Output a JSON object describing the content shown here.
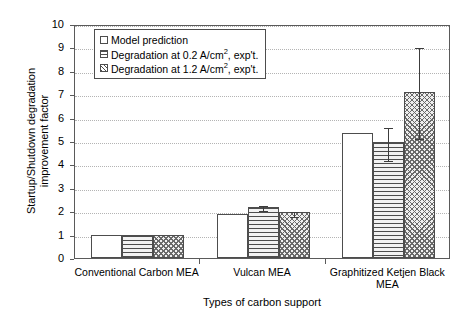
{
  "chart_data": {
    "type": "bar",
    "title": "",
    "xlabel": "Types of carbon support",
    "ylabel": "Startup/Shutdown degradation improvement factor",
    "categories": [
      "Conventional Carbon MEA",
      "Vulcan MEA",
      "Graphitized Ketjen Black MEA"
    ],
    "ylim": [
      0,
      10
    ],
    "ytick_labels": [
      "0",
      "1",
      "2",
      "3",
      "4",
      "5",
      "6",
      "7",
      "8",
      "9",
      "10"
    ],
    "grid": true,
    "legend_position": "upper-left-inside",
    "series": [
      {
        "name": "Model prediction",
        "pattern": "plain",
        "values": [
          1.0,
          1.9,
          5.35
        ],
        "errors": [
          null,
          null,
          null
        ]
      },
      {
        "name": "Degradation at 0.2 A/cm2, exp't.",
        "pattern": "horizontal-lines",
        "values": [
          1.0,
          2.2,
          4.95
        ],
        "errors": [
          null,
          0.12,
          0.7
        ]
      },
      {
        "name": "Degradation at 1.2 A/cm2, exp't.",
        "pattern": "cross-hatch",
        "values": [
          1.0,
          1.95,
          7.1
        ],
        "errors": [
          null,
          0.1,
          1.95
        ]
      }
    ]
  },
  "legend": {
    "items": [
      {
        "label_pre": "Model prediction",
        "label_sup": "",
        "label_post": ""
      },
      {
        "label_pre": "Degradation at 0.2 A/cm",
        "label_sup": "2",
        "label_post": ", exp't."
      },
      {
        "label_pre": "Degradation at 1.2 A/cm",
        "label_sup": "2",
        "label_post": ", exp't."
      }
    ]
  },
  "axes": {
    "x_title": "Types of carbon support",
    "y_title_line1": "Startup/Shutdown degradation",
    "y_title_line2": "improvement factor"
  },
  "colors": {
    "axis": "#5a5a5a",
    "bar_outline": "#4d4d4d",
    "grid": "#b4b4b4",
    "background": "#ffffff",
    "error_bar": "#3c3c3c"
  }
}
